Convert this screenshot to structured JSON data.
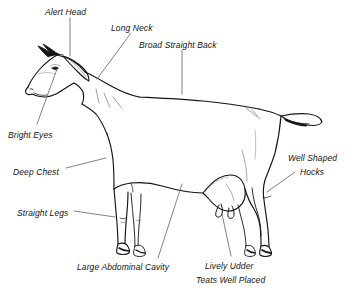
{
  "diagram": {
    "background_color": "#ffffff",
    "ink_color": "#141414",
    "leader_color": "#6b6b6b",
    "labels": [
      {
        "id": "alert-head",
        "text": "Alert Head",
        "x": 45,
        "y": 7,
        "align": "left"
      },
      {
        "id": "long-neck",
        "text": "Long Neck",
        "x": 111,
        "y": 23,
        "align": "left"
      },
      {
        "id": "broad-straight-back",
        "text": "Broad Straight Back",
        "x": 139,
        "y": 40,
        "align": "left"
      },
      {
        "id": "bright-eyes",
        "text": "Bright Eyes",
        "x": 8,
        "y": 130,
        "align": "left"
      },
      {
        "id": "deep-chest",
        "text": "Deep Chest",
        "x": 13,
        "y": 167,
        "align": "left"
      },
      {
        "id": "straight-legs",
        "text": "Straight Legs",
        "x": 17,
        "y": 208,
        "align": "left"
      },
      {
        "id": "well-shaped-hocks",
        "text": "Well Shaped",
        "x": 288,
        "y": 153,
        "align": "left"
      },
      {
        "id": "well-shaped-hocks-2",
        "text": "Hocks",
        "x": 300,
        "y": 167,
        "align": "left"
      },
      {
        "id": "large-abdominal-cavity",
        "text": "Large Abdominal Cavity",
        "x": 77,
        "y": 262,
        "align": "left"
      },
      {
        "id": "lively-udder",
        "text": "Lively Udder",
        "x": 205,
        "y": 261,
        "align": "left"
      },
      {
        "id": "teats-well-placed",
        "text": "Teats Well Placed",
        "x": 196,
        "y": 275,
        "align": "left"
      }
    ],
    "anatomy_parts": [
      "head",
      "horns",
      "ear",
      "eye",
      "muzzle",
      "neck",
      "withers",
      "back",
      "rump",
      "tail",
      "chest",
      "barrel",
      "belly",
      "udder",
      "teats",
      "front-legs",
      "knees",
      "rear-legs",
      "hocks",
      "hooves"
    ]
  }
}
